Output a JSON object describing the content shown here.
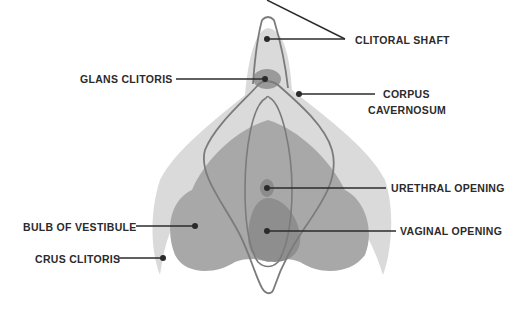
{
  "diagram": {
    "labels": {
      "clitoral_shaft": "CLITORAL SHAFT",
      "glans_clitoris": "GLANS CLITORIS",
      "corpus_cavernosum_line1": "CORPUS",
      "corpus_cavernosum_line2": "CAVERNOSUM",
      "urethral_opening": "URETHRAL OPENING",
      "bulb_of_vestibule": "BULB OF VESTIBULE",
      "vaginal_opening": "VAGINAL OPENING",
      "crus_clitoris": "CRUS CLITORIS"
    },
    "colors": {
      "light_gray": "#d9d9d9",
      "mid_gray": "#a9a9a9",
      "dark_gray": "#8f8f8f",
      "outline": "#7a7a7a",
      "leader": "#2b2b2b"
    }
  }
}
